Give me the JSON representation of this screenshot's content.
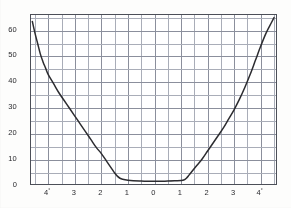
{
  "chart_data": {
    "type": "line",
    "title": "",
    "subtitle": "",
    "xlabel": "",
    "ylabel": "",
    "xlim": [
      -4.65,
      4.65
    ],
    "ylim": [
      0,
      66
    ],
    "grid": true,
    "legend": null,
    "x_tick_labels": [
      "4°",
      "3",
      "2",
      "1",
      "0",
      "1",
      "2",
      "3",
      "4°"
    ],
    "x_tick_values": [
      -4,
      -3,
      -2,
      -1,
      0,
      1,
      2,
      3,
      4
    ],
    "x_tick_unit": "degree",
    "y_tick_labels": [
      "0",
      "10",
      "20",
      "30",
      "40",
      "50",
      "60"
    ],
    "y_tick_values": [
      0,
      10,
      20,
      30,
      40,
      50,
      60
    ],
    "x_major_step": 1,
    "x_minor_step": 0.5,
    "y_major_step": 10,
    "y_minor_step": 5,
    "series": [
      {
        "name": "curve",
        "color": "#2c2c30",
        "x": [
          -4.6,
          -4.5,
          -4.4,
          -4.3,
          -4.2,
          -4.1,
          -4.0,
          -3.8,
          -3.6,
          -3.4,
          -3.2,
          -3.0,
          -2.8,
          -2.6,
          -2.4,
          -2.2,
          -2.0,
          -1.8,
          -1.6,
          -1.5,
          -1.4,
          -1.3,
          -1.2,
          -1.0,
          -0.8,
          -0.5,
          0.0,
          0.5,
          0.8,
          1.0,
          1.1,
          1.2,
          1.3,
          1.4,
          1.6,
          1.8,
          2.0,
          2.2,
          2.4,
          2.6,
          2.8,
          3.0,
          3.2,
          3.4,
          3.6,
          3.8,
          4.0,
          4.2,
          4.4,
          4.5
        ],
        "y": [
          63.5,
          59.0,
          55.0,
          51.0,
          48.0,
          45.5,
          43.0,
          39.5,
          36.0,
          33.0,
          30.0,
          27.0,
          24.0,
          21.0,
          18.0,
          15.0,
          12.5,
          9.5,
          6.5,
          5.0,
          3.8,
          3.0,
          2.6,
          2.2,
          2.0,
          1.9,
          1.8,
          1.9,
          2.0,
          2.1,
          2.3,
          3.0,
          4.2,
          5.5,
          8.0,
          10.5,
          13.5,
          16.5,
          19.5,
          22.5,
          26.0,
          29.5,
          33.5,
          38.0,
          43.0,
          48.5,
          54.0,
          59.0,
          63.0,
          65.0
        ]
      }
    ],
    "annotations": {
      "minimum_value": 1.8,
      "minimum_x": 0.0,
      "flat_region_x": [
        -1.0,
        1.0
      ],
      "shape": "u-shaped symmetric curve with flat minimum near zero"
    },
    "colors": {
      "curve": "#2c2c30",
      "grid_major": "#8b8f9c",
      "grid_minor": "#a9adb8",
      "frame": "#4c4f58",
      "background": "#ffffff",
      "text": "#2a2a2e"
    }
  }
}
